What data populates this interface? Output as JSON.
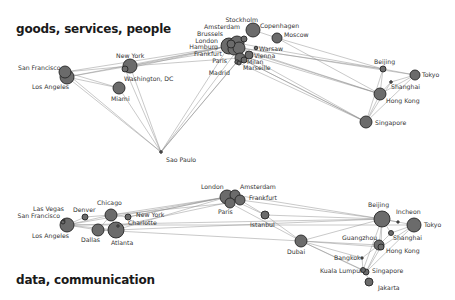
{
  "diagrams": [
    {
      "id": "top",
      "title": "goods, services, people",
      "title_pos": [
        16,
        34
      ],
      "nodes": [
        {
          "name": "San Francisco",
          "x": 65,
          "y": 72,
          "r": 6,
          "lx": 18,
          "ly": 70,
          "anchor": "start"
        },
        {
          "name": "Los Angeles",
          "x": 67,
          "y": 77,
          "r": 7,
          "lx": 32,
          "ly": 89,
          "anchor": "start"
        },
        {
          "name": "New York",
          "x": 130,
          "y": 66,
          "r": 7,
          "lx": 116,
          "ly": 58,
          "anchor": "start"
        },
        {
          "name": "Washington, DC",
          "x": 125,
          "y": 69,
          "r": 3,
          "lx": 124,
          "ly": 81,
          "anchor": "start"
        },
        {
          "name": "Miami",
          "x": 119,
          "y": 88,
          "r": 6,
          "lx": 111,
          "ly": 101,
          "anchor": "start"
        },
        {
          "name": "Sao Paulo",
          "x": 161,
          "y": 152,
          "r": 1.3,
          "lx": 166,
          "ly": 162,
          "anchor": "start"
        },
        {
          "name": "London",
          "x": 229,
          "y": 46,
          "r": 8,
          "lx": 218,
          "ly": 43,
          "anchor": "end"
        },
        {
          "name": "Amsterdam",
          "x": 237,
          "y": 43,
          "r": 7,
          "lx": 240,
          "ly": 29,
          "anchor": "end"
        },
        {
          "name": "Hamburg",
          "x": 234,
          "y": 49,
          "r": 6,
          "lx": 218,
          "ly": 49,
          "anchor": "end"
        },
        {
          "name": "Brussels",
          "x": 231,
          "y": 44,
          "r": 4,
          "lx": 223,
          "ly": 36,
          "anchor": "end"
        },
        {
          "name": "Frankfurt",
          "x": 239,
          "y": 48,
          "r": 6,
          "lx": 222,
          "ly": 56,
          "anchor": "end"
        },
        {
          "name": "Stockholm",
          "x": 244,
          "y": 39,
          "r": 3,
          "lx": 258,
          "ly": 22,
          "anchor": "end"
        },
        {
          "name": "Copenhagen",
          "x": 253,
          "y": 30,
          "r": 7,
          "lx": 260,
          "ly": 28,
          "anchor": "start"
        },
        {
          "name": "Moscow",
          "x": 277,
          "y": 38,
          "r": 5,
          "lx": 284,
          "ly": 37,
          "anchor": "start"
        },
        {
          "name": "Warsaw",
          "x": 256,
          "y": 48,
          "r": 1.8,
          "lx": 259,
          "ly": 51,
          "anchor": "start"
        },
        {
          "name": "Vienna",
          "x": 249,
          "y": 55,
          "r": 4,
          "lx": 254,
          "ly": 58,
          "anchor": "start"
        },
        {
          "name": "Paris",
          "x": 240,
          "y": 58,
          "r": 5,
          "lx": 227,
          "ly": 63,
          "anchor": "end"
        },
        {
          "name": "Milan",
          "x": 244,
          "y": 60,
          "r": 3,
          "lx": 247,
          "ly": 64,
          "anchor": "start"
        },
        {
          "name": "Marseille",
          "x": 239,
          "y": 63,
          "r": 2,
          "lx": 243,
          "ly": 70,
          "anchor": "start"
        },
        {
          "name": "Madrid",
          "x": 237,
          "y": 62,
          "r": 2.2,
          "lx": 230,
          "ly": 75,
          "anchor": "end"
        },
        {
          "name": "Beijing",
          "x": 383,
          "y": 69,
          "r": 3,
          "lx": 374,
          "ly": 64,
          "anchor": "start"
        },
        {
          "name": "Tokyo",
          "x": 415,
          "y": 75,
          "r": 5,
          "lx": 422,
          "ly": 77,
          "anchor": "start"
        },
        {
          "name": "Shanghai",
          "x": 391,
          "y": 82,
          "r": 1.3,
          "lx": 391,
          "ly": 89,
          "anchor": "start"
        },
        {
          "name": "Hong Kong",
          "x": 380,
          "y": 94,
          "r": 6,
          "lx": 386,
          "ly": 103,
          "anchor": "start"
        },
        {
          "name": "Singapore",
          "x": 366,
          "y": 122,
          "r": 6,
          "lx": 375,
          "ly": 125,
          "anchor": "start"
        }
      ]
    },
    {
      "id": "bottom",
      "title": "data, communication",
      "title_pos": [
        16,
        285
      ],
      "nodes": [
        {
          "name": "Las Vegas",
          "x": 64,
          "y": 220,
          "r": 1,
          "lx": 64,
          "ly": 211,
          "anchor": "end"
        },
        {
          "name": "San Francisco",
          "x": 63,
          "y": 222,
          "r": 2,
          "lx": 60,
          "ly": 218,
          "anchor": "end"
        },
        {
          "name": "Los Angeles",
          "x": 67,
          "y": 225,
          "r": 7,
          "lx": 32,
          "ly": 238,
          "anchor": "start"
        },
        {
          "name": "Denver",
          "x": 85,
          "y": 217,
          "r": 3,
          "lx": 73,
          "ly": 212,
          "anchor": "start"
        },
        {
          "name": "Chicago",
          "x": 111,
          "y": 215,
          "r": 6,
          "lx": 97,
          "ly": 205,
          "anchor": "start"
        },
        {
          "name": "Dallas",
          "x": 98,
          "y": 230,
          "r": 6,
          "lx": 81,
          "ly": 242,
          "anchor": "start"
        },
        {
          "name": "Atlanta",
          "x": 116,
          "y": 230,
          "r": 8,
          "lx": 111,
          "ly": 245,
          "anchor": "start"
        },
        {
          "name": "New York",
          "x": 128,
          "y": 217,
          "r": 3,
          "lx": 136,
          "ly": 217,
          "anchor": "start"
        },
        {
          "name": "Charlotte",
          "x": 118,
          "y": 226,
          "r": 1.2,
          "lx": 128,
          "ly": 225,
          "anchor": "start"
        },
        {
          "name": "London",
          "x": 227,
          "y": 197,
          "r": 7,
          "lx": 201,
          "ly": 189,
          "anchor": "start"
        },
        {
          "name": "Amsterdam",
          "x": 235,
          "y": 195,
          "r": 5,
          "lx": 240,
          "ly": 189,
          "anchor": "start"
        },
        {
          "name": "Frankfurt",
          "x": 240,
          "y": 200,
          "r": 5,
          "lx": 249,
          "ly": 200,
          "anchor": "start"
        },
        {
          "name": "Paris",
          "x": 230,
          "y": 203,
          "r": 5,
          "lx": 218,
          "ly": 214,
          "anchor": "start"
        },
        {
          "name": "Istanbul",
          "x": 265,
          "y": 215,
          "r": 4,
          "lx": 250,
          "ly": 227,
          "anchor": "start"
        },
        {
          "name": "Dubai",
          "x": 301,
          "y": 241,
          "r": 6,
          "lx": 287,
          "ly": 254,
          "anchor": "start"
        },
        {
          "name": "Beijing",
          "x": 382,
          "y": 219,
          "r": 8,
          "lx": 368,
          "ly": 207,
          "anchor": "start"
        },
        {
          "name": "Incheon",
          "x": 398,
          "y": 222,
          "r": 1.2,
          "lx": 396,
          "ly": 214,
          "anchor": "start"
        },
        {
          "name": "Tokyo",
          "x": 414,
          "y": 225,
          "r": 7,
          "lx": 424,
          "ly": 227,
          "anchor": "start"
        },
        {
          "name": "Shanghai",
          "x": 391,
          "y": 233,
          "r": 2.5,
          "lx": 393,
          "ly": 240,
          "anchor": "start"
        },
        {
          "name": "Guangzhou",
          "x": 379,
          "y": 245,
          "r": 5,
          "lx": 342,
          "ly": 240,
          "anchor": "start"
        },
        {
          "name": "Hong Kong",
          "x": 381,
          "y": 247,
          "r": 3,
          "lx": 386,
          "ly": 253,
          "anchor": "start"
        },
        {
          "name": "Bangkok",
          "x": 362,
          "y": 258,
          "r": 1.2,
          "lx": 334,
          "ly": 260,
          "anchor": "start"
        },
        {
          "name": "Kuala Lumpur",
          "x": 363,
          "y": 270,
          "r": 2.5,
          "lx": 320,
          "ly": 273,
          "anchor": "start"
        },
        {
          "name": "Singapore",
          "x": 366,
          "y": 272,
          "r": 3,
          "lx": 372,
          "ly": 273,
          "anchor": "start"
        },
        {
          "name": "Jakarta",
          "x": 369,
          "y": 282,
          "r": 4,
          "lx": 378,
          "ly": 290,
          "anchor": "start"
        }
      ]
    }
  ],
  "edges_top": [
    [
      "San Francisco",
      "New York"
    ],
    [
      "Los Angeles",
      "New York"
    ],
    [
      "San Francisco",
      "London"
    ],
    [
      "Los Angeles",
      "London"
    ],
    [
      "Los Angeles",
      "Miami"
    ],
    [
      "San Francisco",
      "Miami"
    ],
    [
      "Los Angeles",
      "Sao Paulo"
    ],
    [
      "San Francisco",
      "Sao Paulo"
    ],
    [
      "New York",
      "London"
    ],
    [
      "New York",
      "Paris"
    ],
    [
      "New York",
      "Frankfurt"
    ],
    [
      "Washington, DC",
      "London"
    ],
    [
      "New York",
      "Sao Paulo"
    ],
    [
      "Miami",
      "Sao Paulo"
    ],
    [
      "Washington, DC",
      "Sao Paulo"
    ],
    [
      "Sao Paulo",
      "London"
    ],
    [
      "Sao Paulo",
      "Madrid"
    ],
    [
      "Sao Paulo",
      "Paris"
    ],
    [
      "Sao Paulo",
      "Frankfurt"
    ],
    [
      "London",
      "Hong Kong"
    ],
    [
      "London",
      "Singapore"
    ],
    [
      "Paris",
      "Singapore"
    ],
    [
      "Frankfurt",
      "Hong Kong"
    ],
    [
      "Frankfurt",
      "Beijing"
    ],
    [
      "Amsterdam",
      "Beijing"
    ],
    [
      "London",
      "Tokyo"
    ],
    [
      "Moscow",
      "Beijing"
    ],
    [
      "Moscow",
      "Hong Kong"
    ],
    [
      "Milan",
      "Singapore"
    ],
    [
      "Marseille",
      "Singapore"
    ],
    [
      "Vienna",
      "Hong Kong"
    ],
    [
      "Copenhagen",
      "Moscow"
    ],
    [
      "Beijing",
      "Tokyo"
    ],
    [
      "Beijing",
      "Hong Kong"
    ],
    [
      "Beijing",
      "Singapore"
    ],
    [
      "Tokyo",
      "Hong Kong"
    ],
    [
      "Tokyo",
      "Singapore"
    ],
    [
      "Shanghai",
      "Hong Kong"
    ],
    [
      "Shanghai",
      "Tokyo"
    ],
    [
      "Hong Kong",
      "Singapore"
    ],
    [
      "Shanghai",
      "Singapore"
    ]
  ],
  "edges_bottom": [
    [
      "Los Angeles",
      "Denver"
    ],
    [
      "Los Angeles",
      "Chicago"
    ],
    [
      "Los Angeles",
      "Dallas"
    ],
    [
      "Los Angeles",
      "Atlanta"
    ],
    [
      "Denver",
      "Chicago"
    ],
    [
      "Chicago",
      "Dallas"
    ],
    [
      "Chicago",
      "Atlanta"
    ],
    [
      "Chicago",
      "New York"
    ],
    [
      "Dallas",
      "Atlanta"
    ],
    [
      "Atlanta",
      "Charlotte"
    ],
    [
      "Chicago",
      "London"
    ],
    [
      "New York",
      "London"
    ],
    [
      "New York",
      "Amsterdam"
    ],
    [
      "Charlotte",
      "Frankfurt"
    ],
    [
      "Atlanta",
      "London"
    ],
    [
      "Los Angeles",
      "London"
    ],
    [
      "Los Angeles",
      "Beijing"
    ],
    [
      "Los Angeles",
      "Tokyo"
    ],
    [
      "Dallas",
      "Dubai"
    ],
    [
      "Atlanta",
      "Beijing"
    ],
    [
      "Chicago",
      "Paris"
    ],
    [
      "London",
      "Istanbul"
    ],
    [
      "Frankfurt",
      "Istanbul"
    ],
    [
      "Istanbul",
      "Dubai"
    ],
    [
      "Frankfurt",
      "Beijing"
    ],
    [
      "Amsterdam",
      "Beijing"
    ],
    [
      "Paris",
      "Dubai"
    ],
    [
      "Istanbul",
      "Beijing"
    ],
    [
      "Dubai",
      "Beijing"
    ],
    [
      "Dubai",
      "Guangzhou"
    ],
    [
      "Dubai",
      "Bangkok"
    ],
    [
      "Dubai",
      "Kuala Lumpur"
    ],
    [
      "Dubai",
      "Singapore"
    ],
    [
      "Dubai",
      "Hong Kong"
    ],
    [
      "Beijing",
      "Tokyo"
    ],
    [
      "Beijing",
      "Incheon"
    ],
    [
      "Beijing",
      "Shanghai"
    ],
    [
      "Beijing",
      "Guangzhou"
    ],
    [
      "Beijing",
      "Hong Kong"
    ],
    [
      "Tokyo",
      "Shanghai"
    ],
    [
      "Tokyo",
      "Hong Kong"
    ],
    [
      "Shanghai",
      "Guangzhou"
    ],
    [
      "Guangzhou",
      "Hong Kong"
    ],
    [
      "Guangzhou",
      "Bangkok"
    ],
    [
      "Hong Kong",
      "Singapore"
    ],
    [
      "Bangkok",
      "Kuala Lumpur"
    ],
    [
      "Kuala Lumpur",
      "Singapore"
    ],
    [
      "Singapore",
      "Jakarta"
    ],
    [
      "Guangzhou",
      "Singapore"
    ],
    [
      "Tokyo",
      "Singapore"
    ],
    [
      "Beijing",
      "Kuala Lumpur"
    ]
  ],
  "colors": {
    "node_fill": "#6b6b6b",
    "node_stroke": "#262626",
    "edge": "#8a8a8a",
    "label": "#333333",
    "title": "#1a1a1a"
  }
}
